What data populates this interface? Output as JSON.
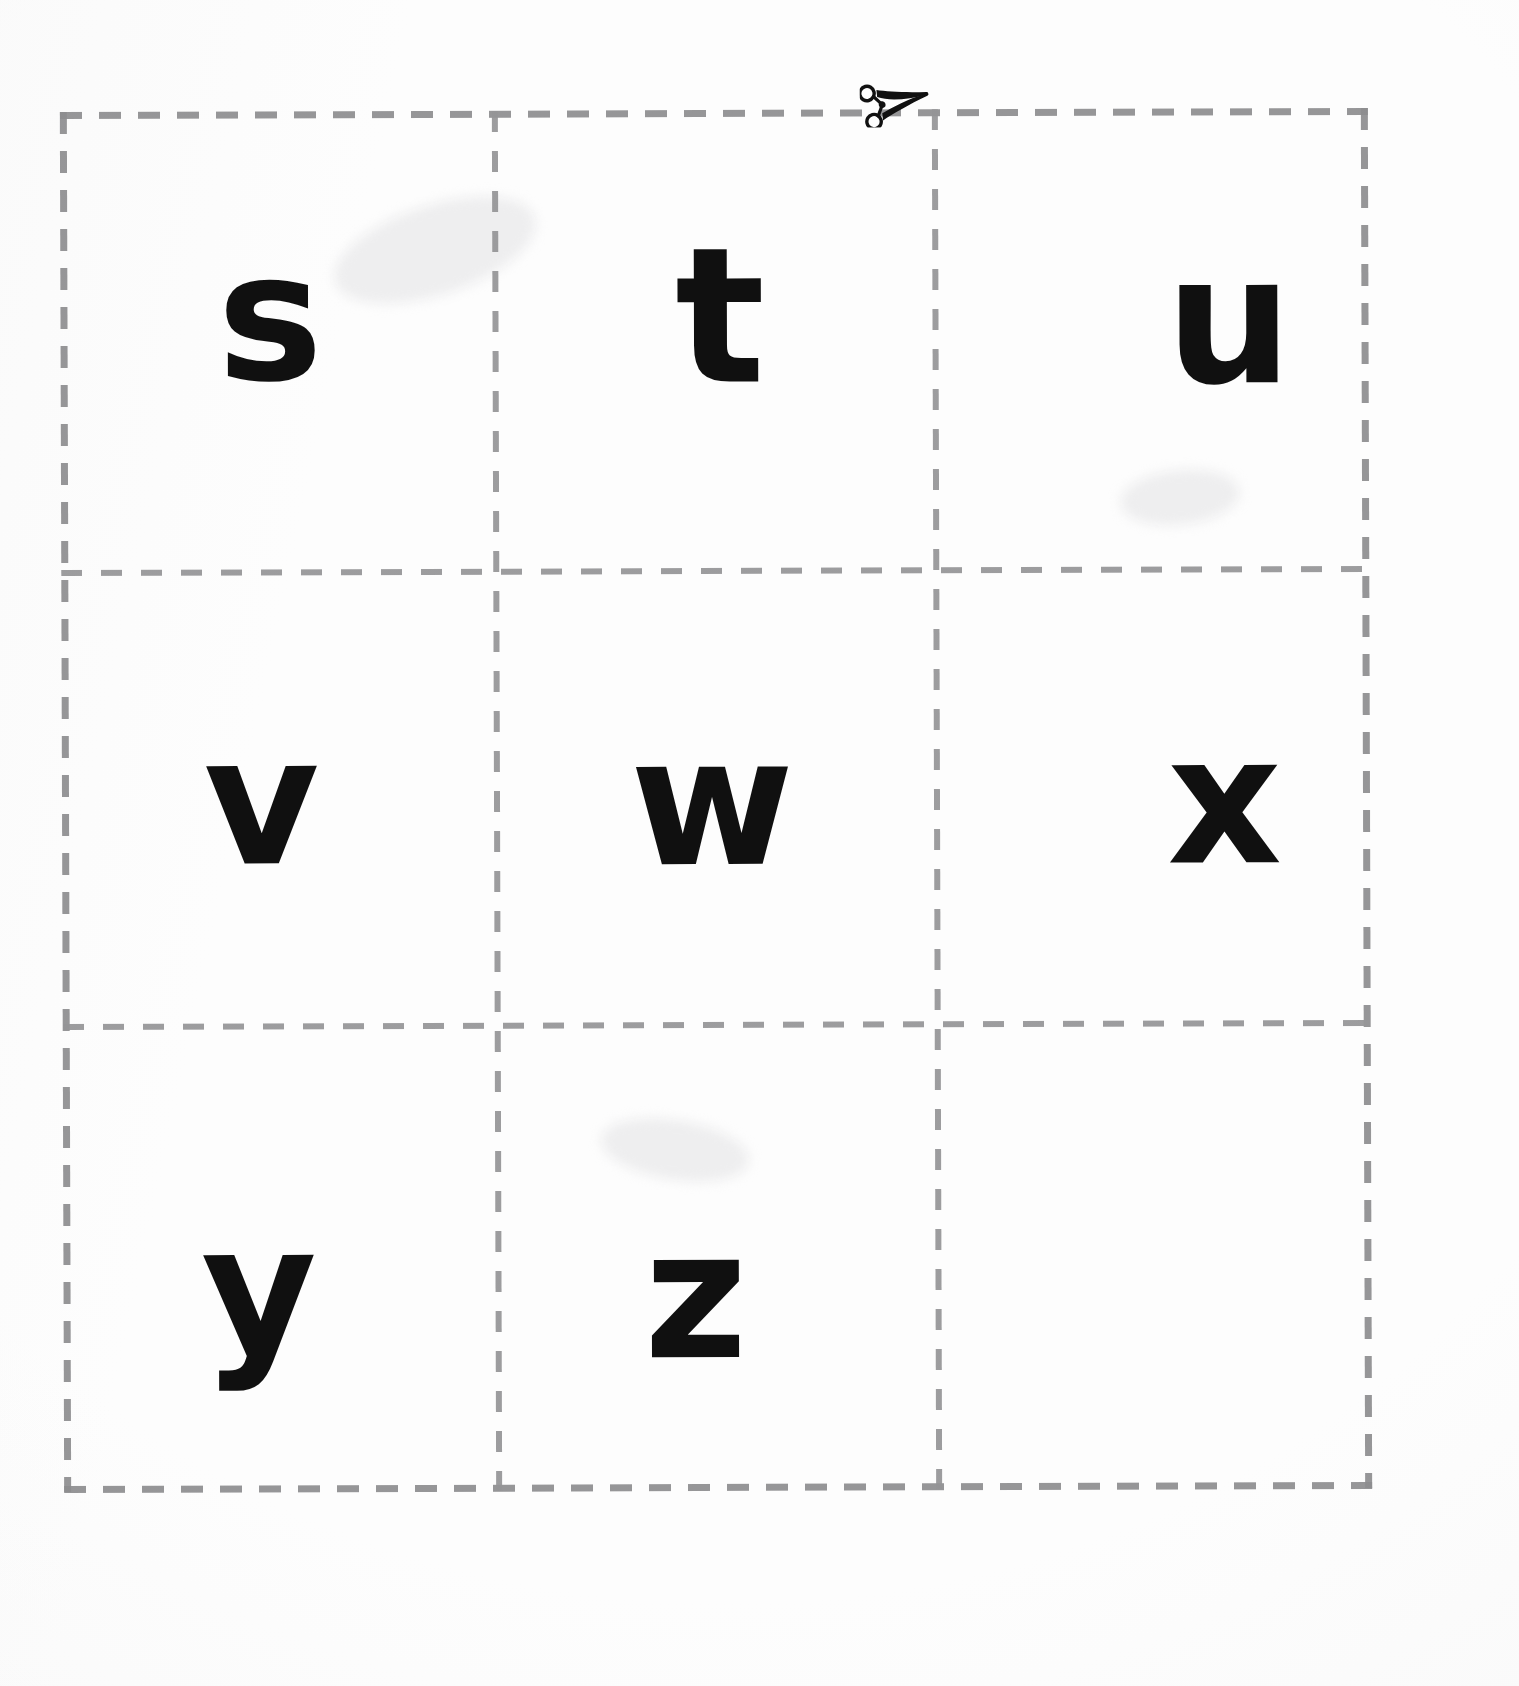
{
  "sheet": {
    "title": "Alphabet Flashcards Cut-Out Sheet",
    "type": "cut-out-flashcard-grid",
    "rows": 3,
    "columns": 3,
    "background_color": "#fdfdfd",
    "letter_color": "#101010",
    "cut_line_color": "#8d8d8f",
    "cut_line_style": "dashed"
  },
  "cut_marker": {
    "icon": "scissors-icon",
    "label": "✂",
    "position": "top-edge",
    "meaning": "cut along the dashed lines"
  },
  "cards": [
    {
      "id": "card-s",
      "letter": "s",
      "row": 1,
      "column": 1
    },
    {
      "id": "card-t",
      "letter": "t",
      "row": 1,
      "column": 2
    },
    {
      "id": "card-u",
      "letter": "u",
      "row": 1,
      "column": 3
    },
    {
      "id": "card-v",
      "letter": "v",
      "row": 2,
      "column": 1
    },
    {
      "id": "card-w",
      "letter": "w",
      "row": 2,
      "column": 2
    },
    {
      "id": "card-x",
      "letter": "x",
      "row": 2,
      "column": 3
    },
    {
      "id": "card-y",
      "letter": "y",
      "row": 3,
      "column": 1
    },
    {
      "id": "card-z",
      "letter": "z",
      "row": 3,
      "column": 2
    },
    {
      "id": "card-blank",
      "letter": "",
      "row": 3,
      "column": 3
    }
  ]
}
